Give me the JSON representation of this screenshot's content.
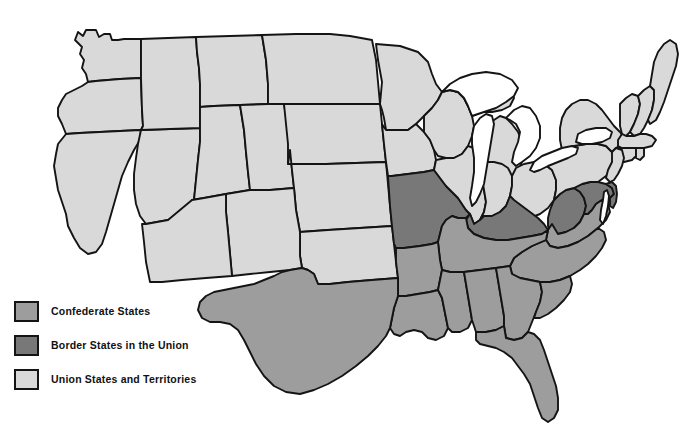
{
  "map": {
    "title": "United States during the Civil War",
    "background_color": "#ffffff",
    "border_color": "#141414",
    "water_color": "#ffffff"
  },
  "legend": {
    "items": [
      {
        "id": "confederate",
        "label": "Confederate States",
        "color": "#9d9d9d"
      },
      {
        "id": "border",
        "label": "Border States in the Union",
        "color": "#787878"
      },
      {
        "id": "union",
        "label": "Union States and Territories",
        "color": "#d9d9d9"
      }
    ]
  },
  "regions": {
    "confederate": [
      "Virginia",
      "North Carolina",
      "South Carolina",
      "Georgia",
      "Florida",
      "Alabama",
      "Mississippi",
      "Louisiana",
      "Texas",
      "Arkansas",
      "Tennessee"
    ],
    "border": [
      "Missouri",
      "Kentucky",
      "West Virginia",
      "Maryland",
      "Delaware"
    ],
    "union": [
      "Washington Territory",
      "Oregon",
      "California",
      "Nevada Territory",
      "Idaho Territory",
      "Montana Territory",
      "Dakota Territory",
      "Nebraska Territory",
      "Utah Territory",
      "Colorado Territory",
      "Arizona Territory",
      "New Mexico Territory",
      "Indian Territory",
      "Kansas",
      "Minnesota",
      "Iowa",
      "Wisconsin",
      "Illinois",
      "Michigan",
      "Indiana",
      "Ohio",
      "Pennsylvania",
      "New York",
      "New Jersey",
      "Connecticut",
      "Rhode Island",
      "Massachusetts",
      "Vermont",
      "New Hampshire",
      "Maine"
    ],
    "water": [
      "Lake Superior",
      "Lake Michigan",
      "Lake Huron",
      "Lake Erie",
      "Lake Ontario",
      "Chesapeake Bay"
    ]
  }
}
